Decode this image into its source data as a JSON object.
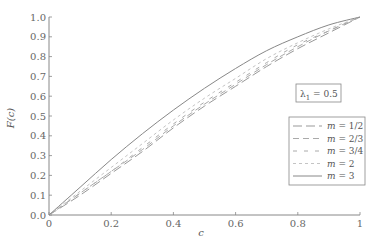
{
  "chart_data": {
    "type": "line",
    "title": "",
    "xlabel": "c",
    "ylabel": "F(c)",
    "xlim": [
      0,
      1
    ],
    "ylim": [
      0,
      1
    ],
    "grid": false,
    "legend_position": "right-middle",
    "annotation": "λ1 = 0.5",
    "x_ticks": [
      "0",
      "0.2",
      "0.4",
      "0.6",
      "0.8",
      "1"
    ],
    "y_ticks": [
      "0.0",
      "0.1",
      "0.2",
      "0.3",
      "0.4",
      "0.5",
      "0.6",
      "0.7",
      "0.8",
      "0.9",
      "1.0"
    ],
    "x": [
      0,
      0.1,
      0.2,
      0.3,
      0.4,
      0.5,
      0.6,
      0.7,
      0.8,
      0.9,
      1.0
    ],
    "series": [
      {
        "name": "m = 1/2",
        "style": "long-dash",
        "values": [
          0,
          0.1,
          0.21,
          0.32,
          0.44,
          0.55,
          0.65,
          0.75,
          0.84,
          0.92,
          1.0
        ]
      },
      {
        "name": "m = 2/3",
        "style": "dash",
        "values": [
          0,
          0.11,
          0.22,
          0.33,
          0.45,
          0.56,
          0.66,
          0.76,
          0.85,
          0.93,
          1.0
        ]
      },
      {
        "name": "m = 3/4",
        "style": "sparse-dash",
        "values": [
          0,
          0.11,
          0.22,
          0.34,
          0.46,
          0.57,
          0.67,
          0.77,
          0.86,
          0.93,
          1.0
        ]
      },
      {
        "name": "m = 2",
        "style": "short-dash",
        "values": [
          0,
          0.12,
          0.24,
          0.36,
          0.48,
          0.59,
          0.69,
          0.79,
          0.87,
          0.94,
          1.0
        ]
      },
      {
        "name": "m = 3",
        "style": "solid",
        "values": [
          0,
          0.14,
          0.28,
          0.41,
          0.53,
          0.64,
          0.74,
          0.83,
          0.9,
          0.96,
          1.0
        ]
      }
    ]
  },
  "labels": {
    "xlabel": "c",
    "ylabel": "F(c)",
    "annotation": "λ",
    "annotation_sub": "1",
    "annotation_value": " = 0.5",
    "legend": [
      "m = 1/2",
      "m = 2/3",
      "m = 3/4",
      "m = 2",
      "m = 3"
    ]
  }
}
